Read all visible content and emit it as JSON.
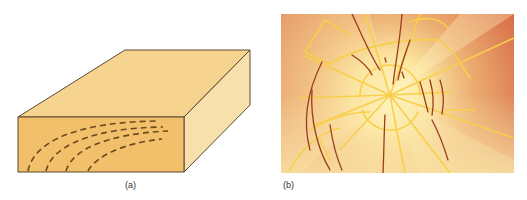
{
  "figure": {
    "panels": [
      {
        "id": "a",
        "label": "(a)",
        "subject": "wood-block-with-growth-ring-grain",
        "colors": {
          "front_face": "#f2c06a",
          "top_face": "#f6d38f",
          "right_face": "#f8e0ad",
          "outline": "#5a4a30",
          "grain_dashes": "#6b4a1f"
        }
      },
      {
        "id": "b",
        "label": "(b)",
        "subject": "radial-crack-pattern",
        "colors": {
          "center_glow": "#fff3b8",
          "outer_background": "#d9704a",
          "yellow_lines": "#f7cf4a",
          "brown_lines": "#9a3d22"
        }
      }
    ]
  }
}
